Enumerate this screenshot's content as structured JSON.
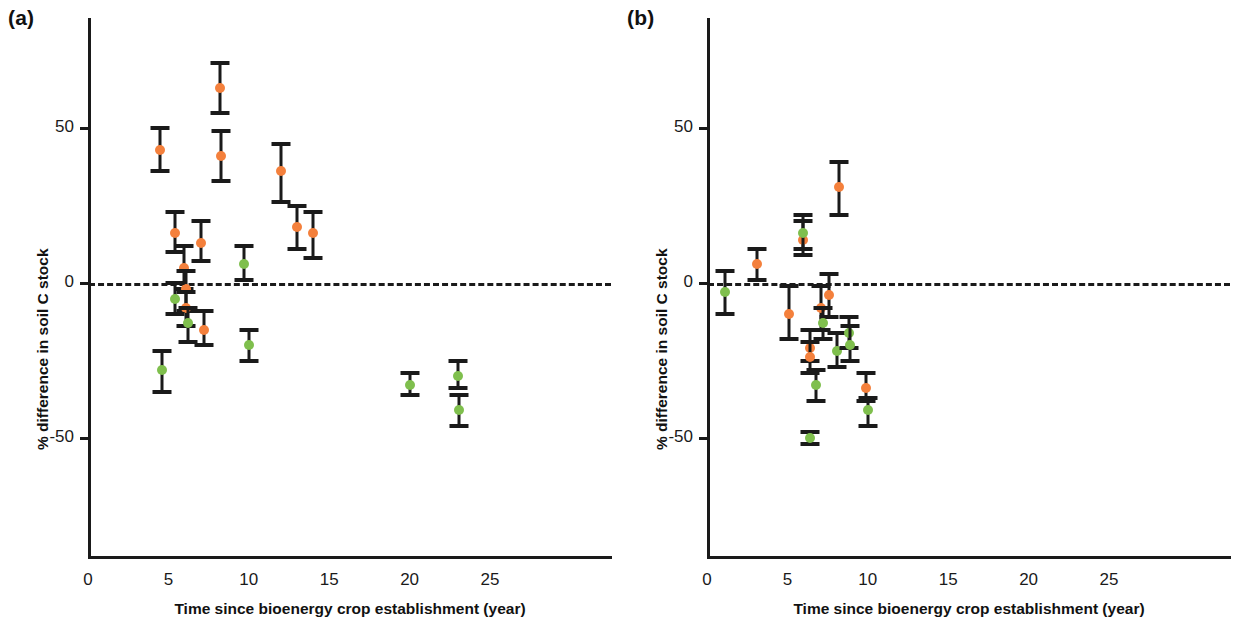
{
  "figure": {
    "panels": [
      {
        "label": "(a)",
        "xlabel": "Time since bioenergy crop establishment (year)",
        "ylabel": "% difference in soil C stock"
      },
      {
        "label": "(b)",
        "xlabel": "Time since bioenergy crop establishment (year)",
        "ylabel": "% difference in soil C stock"
      }
    ]
  },
  "axes": {
    "x_ticks": [
      "0",
      "5",
      "10",
      "15",
      "20",
      "25"
    ],
    "y_ticks": [
      "50",
      "0",
      "-50"
    ],
    "x_tick_values": [
      0,
      5,
      10,
      15,
      20,
      25
    ],
    "y_tick_values": [
      50,
      0,
      -50
    ]
  },
  "colors": {
    "orange": "#F4803C",
    "green": "#7FBF4D",
    "axis": "#1a1a1a",
    "background": "#ffffff"
  },
  "chart_data": [
    {
      "type": "scatter",
      "panel": "(a)",
      "title": "",
      "xlabel": "Time since bioenergy crop establishment (year)",
      "ylabel": "% difference in soil C stock",
      "xlim": [
        0,
        26.5
      ],
      "ylim": [
        -62,
        82
      ],
      "grid": false,
      "legend": "none",
      "reference_line": {
        "y": 0,
        "style": "dashed"
      },
      "series": [
        {
          "name": "orange",
          "color": "#F4803C",
          "points": [
            {
              "x": 4.5,
              "y": 43,
              "err_low": 36,
              "err_high": 50
            },
            {
              "x": 5.4,
              "y": 16,
              "err_low": 10,
              "err_high": 23
            },
            {
              "x": 6.0,
              "y": 5,
              "err_low": -2,
              "err_high": 12
            },
            {
              "x": 6.1,
              "y": -2,
              "err_low": -9,
              "err_high": 4
            },
            {
              "x": 6.1,
              "y": -8,
              "err_low": -14,
              "err_high": -3
            },
            {
              "x": 7.0,
              "y": 13,
              "err_low": 7,
              "err_high": 20
            },
            {
              "x": 7.2,
              "y": -15,
              "err_low": -20,
              "err_high": -9
            },
            {
              "x": 8.2,
              "y": 63,
              "err_low": 55,
              "err_high": 71
            },
            {
              "x": 8.3,
              "y": 41,
              "err_low": 33,
              "err_high": 49
            },
            {
              "x": 12.0,
              "y": 36,
              "err_low": 26,
              "err_high": 45
            },
            {
              "x": 13.0,
              "y": 18,
              "err_low": 11,
              "err_high": 25
            },
            {
              "x": 14.0,
              "y": 16,
              "err_low": 8,
              "err_high": 23
            }
          ]
        },
        {
          "name": "green",
          "color": "#7FBF4D",
          "points": [
            {
              "x": 4.6,
              "y": -28,
              "err_low": -35,
              "err_high": -22
            },
            {
              "x": 5.4,
              "y": -5,
              "err_low": -10,
              "err_high": 0
            },
            {
              "x": 6.2,
              "y": -13,
              "err_low": -19,
              "err_high": -8
            },
            {
              "x": 9.7,
              "y": 6,
              "err_low": 1,
              "err_high": 12
            },
            {
              "x": 10.0,
              "y": -20,
              "err_low": -25,
              "err_high": -15
            },
            {
              "x": 20.0,
              "y": -33,
              "err_low": -36,
              "err_high": -29
            },
            {
              "x": 23.0,
              "y": -30,
              "err_low": -34,
              "err_high": -25
            },
            {
              "x": 23.1,
              "y": -41,
              "err_low": -46,
              "err_high": -36
            }
          ]
        }
      ]
    },
    {
      "type": "scatter",
      "panel": "(b)",
      "title": "",
      "xlabel": "Time since bioenergy crop establishment (year)",
      "ylabel": "% difference in soil C stock",
      "xlim": [
        0,
        26.5
      ],
      "ylim": [
        -62,
        82
      ],
      "grid": false,
      "legend": "none",
      "reference_line": {
        "y": 0,
        "style": "dashed"
      },
      "series": [
        {
          "name": "orange",
          "color": "#F4803C",
          "points": [
            {
              "x": 3.1,
              "y": 6,
              "err_low": 1,
              "err_high": 11
            },
            {
              "x": 5.1,
              "y": -10,
              "err_low": -18,
              "err_high": -1
            },
            {
              "x": 6.0,
              "y": 14,
              "err_low": 9,
              "err_high": 20
            },
            {
              "x": 6.4,
              "y": -21,
              "err_low": -25,
              "err_high": -15
            },
            {
              "x": 6.4,
              "y": -24,
              "err_low": -29,
              "err_high": -19
            },
            {
              "x": 7.1,
              "y": -8,
              "err_low": -15,
              "err_high": -1
            },
            {
              "x": 7.6,
              "y": -4,
              "err_low": -11,
              "err_high": 3
            },
            {
              "x": 8.2,
              "y": 31,
              "err_low": 22,
              "err_high": 39
            },
            {
              "x": 9.9,
              "y": -34,
              "err_low": -38,
              "err_high": -29
            }
          ]
        },
        {
          "name": "green",
          "color": "#7FBF4D",
          "points": [
            {
              "x": 1.1,
              "y": -3,
              "err_low": -10,
              "err_high": 4
            },
            {
              "x": 6.0,
              "y": 16,
              "err_low": 11,
              "err_high": 22
            },
            {
              "x": 6.4,
              "y": -50,
              "err_low": -52,
              "err_high": -48
            },
            {
              "x": 6.8,
              "y": -33,
              "err_low": -38,
              "err_high": -28
            },
            {
              "x": 7.2,
              "y": -13,
              "err_low": -18,
              "err_high": -8
            },
            {
              "x": 8.1,
              "y": -22,
              "err_low": -27,
              "err_high": -16
            },
            {
              "x": 8.8,
              "y": -16,
              "err_low": -21,
              "err_high": -11
            },
            {
              "x": 8.9,
              "y": -20,
              "err_low": -25,
              "err_high": -14
            },
            {
              "x": 10.0,
              "y": -41,
              "err_low": -46,
              "err_high": -37
            }
          ]
        }
      ]
    }
  ]
}
